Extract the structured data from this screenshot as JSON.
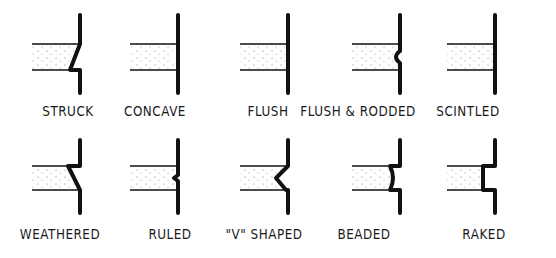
{
  "colors": {
    "ink": "#111111",
    "mortar_dots": "#777777",
    "background": "#ffffff"
  },
  "joints": [
    {
      "id": "struck",
      "label": "STRUCK",
      "row": 0,
      "col": 0
    },
    {
      "id": "concave",
      "label": "CONCAVE",
      "row": 0,
      "col": 1
    },
    {
      "id": "flush",
      "label": "FLUSH",
      "row": 0,
      "col": 2
    },
    {
      "id": "flush-rodded",
      "label": "FLUSH & RODDED",
      "row": 0,
      "col": 3
    },
    {
      "id": "scintled",
      "label": "SCINTLED",
      "row": 0,
      "col": 4
    },
    {
      "id": "weathered",
      "label": "WEATHERED",
      "row": 1,
      "col": 0
    },
    {
      "id": "ruled",
      "label": "RULED",
      "row": 1,
      "col": 1
    },
    {
      "id": "v-shaped",
      "label": "\"V\" SHAPED",
      "row": 1,
      "col": 2
    },
    {
      "id": "beaded",
      "label": "BEADED",
      "row": 1,
      "col": 3
    },
    {
      "id": "raked",
      "label": "RAKED",
      "row": 1,
      "col": 4
    }
  ]
}
